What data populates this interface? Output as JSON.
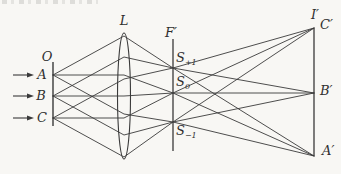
{
  "figure": {
    "type": "optics-ray-diagram",
    "colors": {
      "paper": "#f8f7f4",
      "ink": "#3a3a3a"
    },
    "labels": {
      "object_plane": "O",
      "point_a": "A",
      "point_b": "B",
      "point_c": "C",
      "lens": "L",
      "focal_plane": "F′",
      "spot_plus": {
        "base": "S",
        "sub": "+1"
      },
      "spot_zero": {
        "base": "S",
        "sub": "0"
      },
      "spot_minus": {
        "base": "S",
        "sub": "−1"
      },
      "image_plane": "I′",
      "image_c": "C′",
      "image_b": "B′",
      "image_a": "A′"
    },
    "geometry": {
      "object_line": {
        "x": 53,
        "y1": 62,
        "y2": 126
      },
      "focal_line": {
        "x": 173,
        "y1": 39,
        "y2": 151
      },
      "image_line": {
        "x": 314,
        "y1": 28,
        "y2": 156
      },
      "lens": {
        "cx": 124,
        "cy": 96,
        "rx": 6.5,
        "ry": 63
      },
      "arrows": [
        {
          "x1": 13,
          "x2": 34,
          "y": 75
        },
        {
          "x1": 13,
          "x2": 34,
          "y": 96
        },
        {
          "x1": 13,
          "x2": 34,
          "y": 118
        }
      ],
      "rays": [
        [
          [
            53,
            75
          ],
          [
            124,
            36
          ],
          [
            173,
            68
          ],
          [
            314,
            156
          ]
        ],
        [
          [
            53,
            75
          ],
          [
            124,
            75
          ],
          [
            173,
            93
          ],
          [
            314,
            156
          ]
        ],
        [
          [
            53,
            75
          ],
          [
            124,
            114
          ],
          [
            173,
            122
          ],
          [
            314,
            156
          ]
        ],
        [
          [
            53,
            96
          ],
          [
            124,
            57
          ],
          [
            173,
            68
          ],
          [
            314,
            93
          ]
        ],
        [
          [
            53,
            96
          ],
          [
            124,
            96
          ],
          [
            173,
            93
          ],
          [
            314,
            93
          ]
        ],
        [
          [
            53,
            96
          ],
          [
            124,
            135
          ],
          [
            173,
            122
          ],
          [
            314,
            93
          ]
        ],
        [
          [
            53,
            118
          ],
          [
            124,
            79
          ],
          [
            173,
            68
          ],
          [
            314,
            28
          ]
        ],
        [
          [
            53,
            118
          ],
          [
            124,
            118
          ],
          [
            173,
            93
          ],
          [
            314,
            28
          ]
        ],
        [
          [
            53,
            118
          ],
          [
            124,
            157
          ],
          [
            173,
            122
          ],
          [
            314,
            28
          ]
        ]
      ]
    }
  }
}
